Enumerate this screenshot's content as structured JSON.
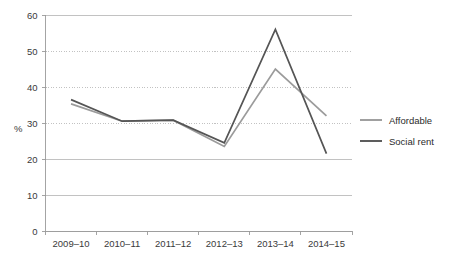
{
  "chart_data": {
    "type": "line",
    "title": "",
    "subtitle": "",
    "xlabel": "",
    "ylabel": "%",
    "categories": [
      "2009–10",
      "2010–11",
      "2011–12",
      "2012–13",
      "2013–14",
      "2014–15"
    ],
    "ylim": [
      0,
      60
    ],
    "yticks": [
      0,
      10,
      20,
      30,
      40,
      50,
      60
    ],
    "ytick_labels": [
      "0",
      "10",
      "20",
      "30",
      "40",
      "50",
      "60"
    ],
    "grid": true,
    "grid_axis": "y",
    "legend_position": "right",
    "series": [
      {
        "name": "Affordable",
        "color": "#9b9b9b",
        "values": [
          35.3,
          30.5,
          30.8,
          23.5,
          45.0,
          32.0
        ]
      },
      {
        "name": "Social rent",
        "color": "#555555",
        "values": [
          36.5,
          30.5,
          30.8,
          24.5,
          56.0,
          21.5
        ]
      }
    ]
  },
  "legend": {
    "items": [
      {
        "label": "Affordable"
      },
      {
        "label": "Social rent"
      }
    ]
  },
  "colors": {
    "affordable": "#9b9b9b",
    "social_rent": "#555555",
    "gridline": "#a8a8a8",
    "axis": "#9a9a9a",
    "text": "#2b2b2b",
    "background": "#ffffff"
  }
}
